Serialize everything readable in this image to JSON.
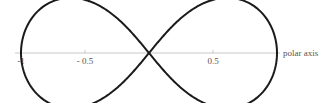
{
  "diagram": {
    "curve": {
      "equation": "r^2 = cos(2θ)",
      "stroke_color": "#1a1a1a",
      "stroke_width": 2
    },
    "axis": {
      "label": "polar axis",
      "color": "#c8c8c8",
      "ticks": [
        {
          "value": -1,
          "label": "-1"
        },
        {
          "value": -0.5,
          "label": "- 0.5"
        },
        {
          "value": 0.5,
          "label": "0.5"
        }
      ]
    },
    "layout": {
      "origin_x": 149,
      "origin_y": 53,
      "scale": 128,
      "axis_x_start": 15,
      "axis_x_end": 280
    }
  }
}
